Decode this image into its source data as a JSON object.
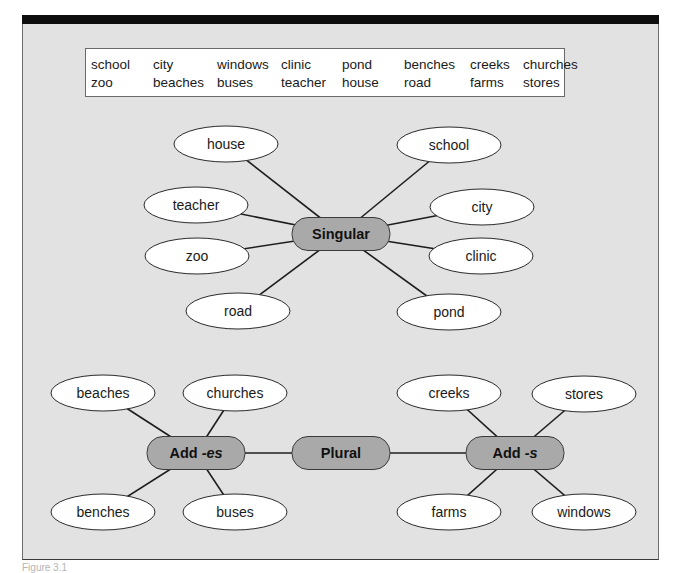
{
  "figure": {
    "caption": "Figure 3.1"
  },
  "word_bank": {
    "rows": [
      [
        "school",
        "city",
        "windows",
        "clinic",
        "pond",
        "benches",
        "creeks",
        "churches"
      ],
      [
        "zoo",
        "beaches",
        "buses",
        "teacher",
        "house",
        "road",
        "farms",
        "stores"
      ]
    ]
  },
  "colors": {
    "panel": "#e2e2e2",
    "hub_fill": "#a9a9a9",
    "leaf_fill": "#ffffff",
    "line": "#1e1e1e"
  },
  "diagram": {
    "hubs": [
      {
        "id": "singular",
        "label": "Singular",
        "suffix": ""
      },
      {
        "id": "plural",
        "label": "Plural",
        "suffix": ""
      },
      {
        "id": "add_es",
        "label": "Add ",
        "suffix": "-es"
      },
      {
        "id": "add_s",
        "label": "Add ",
        "suffix": "-s"
      }
    ],
    "leaves": [
      {
        "id": "house",
        "label": "house",
        "parent": "singular"
      },
      {
        "id": "school",
        "label": "school",
        "parent": "singular"
      },
      {
        "id": "teacher",
        "label": "teacher",
        "parent": "singular"
      },
      {
        "id": "city",
        "label": "city",
        "parent": "singular"
      },
      {
        "id": "zoo",
        "label": "zoo",
        "parent": "singular"
      },
      {
        "id": "clinic",
        "label": "clinic",
        "parent": "singular"
      },
      {
        "id": "road",
        "label": "road",
        "parent": "singular"
      },
      {
        "id": "pond",
        "label": "pond",
        "parent": "singular"
      },
      {
        "id": "beaches",
        "label": "beaches",
        "parent": "add_es"
      },
      {
        "id": "churches",
        "label": "churches",
        "parent": "add_es"
      },
      {
        "id": "benches",
        "label": "benches",
        "parent": "add_es"
      },
      {
        "id": "buses",
        "label": "buses",
        "parent": "add_es"
      },
      {
        "id": "creeks",
        "label": "creeks",
        "parent": "add_s"
      },
      {
        "id": "stores",
        "label": "stores",
        "parent": "add_s"
      },
      {
        "id": "farms",
        "label": "farms",
        "parent": "add_s"
      },
      {
        "id": "windows",
        "label": "windows",
        "parent": "add_s"
      }
    ],
    "hub_links": [
      [
        "plural",
        "add_es"
      ],
      [
        "plural",
        "add_s"
      ]
    ]
  }
}
